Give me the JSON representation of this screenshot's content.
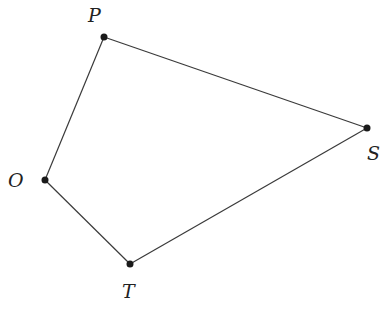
{
  "diagram": {
    "type": "quadrilateral",
    "points": [
      {
        "id": "P",
        "label": "P",
        "x": 104,
        "y": 37,
        "lx": 95,
        "ly": 22
      },
      {
        "id": "S",
        "label": "S",
        "x": 367,
        "y": 128,
        "lx": 374,
        "ly": 160
      },
      {
        "id": "T",
        "label": "T",
        "x": 130,
        "y": 264,
        "lx": 130,
        "ly": 298
      },
      {
        "id": "O",
        "label": "O",
        "x": 45,
        "y": 180,
        "lx": 18,
        "ly": 188
      }
    ],
    "edges": [
      [
        "P",
        "S"
      ],
      [
        "S",
        "T"
      ],
      [
        "T",
        "O"
      ],
      [
        "O",
        "P"
      ]
    ],
    "colors": {
      "line": "#3a3a3a",
      "point": "#1a1a1a"
    }
  }
}
